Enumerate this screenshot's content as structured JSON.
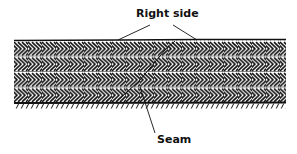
{
  "figure": {
    "labels": {
      "right_side": "Right side",
      "seam": "Seam"
    },
    "colors": {
      "ink": "#111111",
      "background": "#ffffff"
    },
    "band": {
      "x_start": 14,
      "x_end": 286,
      "top": 40,
      "bottom": 103,
      "rows": 4
    }
  }
}
